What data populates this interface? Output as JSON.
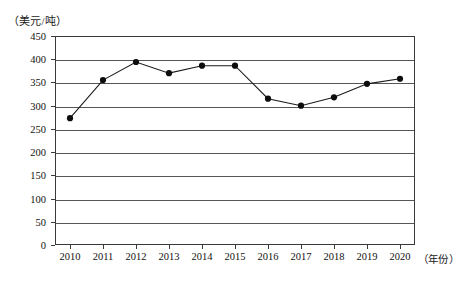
{
  "chart_data": {
    "type": "line",
    "title": "",
    "xlabel": "（年份）",
    "ylabel": "（美元/吨）",
    "categories": [
      "2010",
      "2011",
      "2012",
      "2013",
      "2014",
      "2015",
      "2016",
      "2017",
      "2018",
      "2019",
      "2020"
    ],
    "values": [
      273,
      355,
      394,
      370,
      386,
      386,
      315,
      300,
      318,
      347,
      358
    ],
    "series": [
      {
        "name": "价格",
        "values": [
          273,
          355,
          394,
          370,
          386,
          386,
          315,
          300,
          318,
          347,
          358
        ]
      }
    ],
    "ylim": [
      0,
      450
    ],
    "xlim": [
      "2010",
      "2020"
    ],
    "y_ticks": [
      0,
      50,
      100,
      150,
      200,
      250,
      300,
      350,
      400,
      450
    ],
    "y_tick_labels": [
      "0",
      "50",
      "100",
      "150",
      "200",
      "250",
      "300",
      "350",
      "400",
      "450"
    ],
    "x_tick_labels": [
      "2010",
      "2011",
      "2012",
      "2013",
      "2014",
      "2015",
      "2016",
      "2017",
      "2018",
      "2019",
      "2020"
    ],
    "grid": true,
    "grid_axis": "y",
    "legend": null,
    "legend_position": "none",
    "marker": "circle",
    "line_color": "#1a1a1a",
    "marker_color": "#0d0d0d",
    "grid_color": "#555555",
    "frame_color": "#3a3a3a",
    "background_color": "#ffffff",
    "annotations": []
  },
  "axes": {
    "y_unit_caption": "（美元/吨）",
    "x_unit_caption": "（年份）"
  }
}
